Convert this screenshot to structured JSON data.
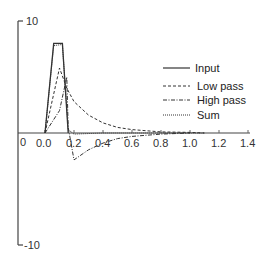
{
  "chart_data": {
    "type": "line",
    "title": "",
    "xlabel": "",
    "ylabel": "",
    "xlim": [
      0,
      1.4
    ],
    "ylim": [
      -10,
      10
    ],
    "grid": false,
    "legend_position": "upper right",
    "x_ticks": [
      "0.0",
      "0.2",
      "0.4",
      "0.6",
      "0.8",
      "1.0",
      "1.2",
      "1.4"
    ],
    "y_ticks": [
      "10",
      "-10"
    ],
    "origin_label": "0",
    "series": [
      {
        "name": "Input",
        "style": "solid",
        "x": [
          0.0,
          0.06,
          0.12,
          0.16
        ],
        "y": [
          0,
          8,
          8,
          0
        ]
      },
      {
        "name": "Low pass",
        "style": "dashed",
        "x": [
          0.0,
          0.1,
          0.15,
          0.2,
          0.3,
          0.4,
          0.5,
          0.6,
          0.8,
          1.0,
          1.1
        ],
        "y": [
          0,
          5.8,
          4.0,
          2.8,
          1.6,
          0.9,
          0.5,
          0.3,
          0.1,
          0.05,
          0
        ]
      },
      {
        "name": "High pass",
        "style": "dash-dot",
        "x": [
          0.0,
          0.1,
          0.15,
          0.16,
          0.2,
          0.3,
          0.4,
          0.5,
          0.6,
          0.8,
          1.0
        ],
        "y": [
          0,
          2.0,
          5.0,
          0.5,
          -2.4,
          -1.5,
          -0.9,
          -0.5,
          -0.3,
          -0.1,
          0
        ]
      },
      {
        "name": "Sum",
        "style": "dotted",
        "x": [
          0.0,
          0.06,
          0.12,
          0.16,
          0.2,
          0.4,
          0.6,
          0.8,
          1.0,
          1.1
        ],
        "y": [
          0,
          7.8,
          7.9,
          0.3,
          -0.1,
          0,
          0,
          0,
          0,
          0
        ]
      }
    ]
  }
}
